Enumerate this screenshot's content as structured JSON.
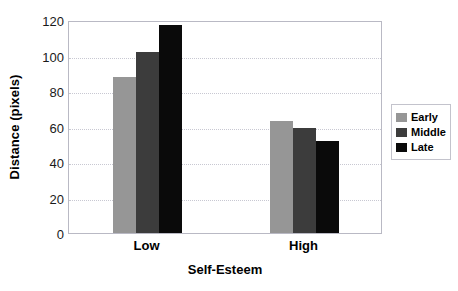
{
  "chart_data": {
    "type": "bar",
    "title": "",
    "xlabel": "Self-Esteem",
    "ylabel": "Distance (pixels)",
    "categories": [
      "Low",
      "High"
    ],
    "series": [
      {
        "name": "Early",
        "values": [
          88,
          63
        ],
        "color": "#969696"
      },
      {
        "name": "Middle",
        "values": [
          102,
          59
        ],
        "color": "#3c3c3c"
      },
      {
        "name": "Late",
        "values": [
          117,
          52
        ],
        "color": "#0a0a0a"
      }
    ],
    "ylim": [
      0,
      120
    ],
    "yticks": [
      0,
      20,
      40,
      60,
      80,
      100,
      120
    ],
    "ytick_labels": [
      "0",
      "20",
      "40",
      "60",
      "80",
      "100",
      "120"
    ],
    "grid": true,
    "grid_style": "dotted",
    "grid_color": "#c8c8d2",
    "legend_position": "right",
    "legend_entries": [
      "Early",
      "Middle",
      "Late"
    ],
    "plot_border_color": "#b9b9c4",
    "background": "#ffffff"
  }
}
